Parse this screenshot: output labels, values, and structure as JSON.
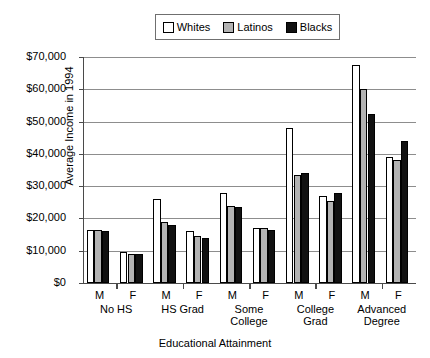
{
  "chart_data": {
    "type": "bar",
    "title": "",
    "xlabel": "Educational Attainment",
    "ylabel": "Average Income in 1994",
    "ylim": [
      0,
      70000
    ],
    "ytick_values": [
      0,
      10000,
      20000,
      30000,
      40000,
      50000,
      60000,
      70000
    ],
    "ytick_labels": [
      "$0",
      "$10,000",
      "$20,000",
      "$30,000",
      "$40,000",
      "$50,000",
      "$60,000",
      "$70,000"
    ],
    "grid": true,
    "legend_position": "top-center",
    "group_labels": [
      "No HS",
      "HS Grad",
      "Some College",
      "College Grad",
      "Advanced Degree"
    ],
    "sub_labels": [
      "M",
      "F"
    ],
    "categories": [
      "No HS M",
      "No HS F",
      "HS Grad M",
      "HS Grad F",
      "Some College M",
      "Some College F",
      "College Grad M",
      "College Grad F",
      "Advanced Degree M",
      "Advanced Degree F"
    ],
    "series": [
      {
        "name": "Whites",
        "color": "#ffffff",
        "values": [
          16500,
          9500,
          26000,
          16000,
          28000,
          17000,
          48000,
          27000,
          67500,
          39000
        ]
      },
      {
        "name": "Latinos",
        "color": "#b3b3b3",
        "values": [
          16300,
          9000,
          19000,
          14500,
          24000,
          17000,
          33500,
          25500,
          60000,
          38000
        ]
      },
      {
        "name": "Blacks",
        "color": "#111111",
        "values": [
          16000,
          9000,
          18000,
          14000,
          23500,
          16500,
          34000,
          28000,
          52500,
          44000
        ]
      }
    ]
  }
}
